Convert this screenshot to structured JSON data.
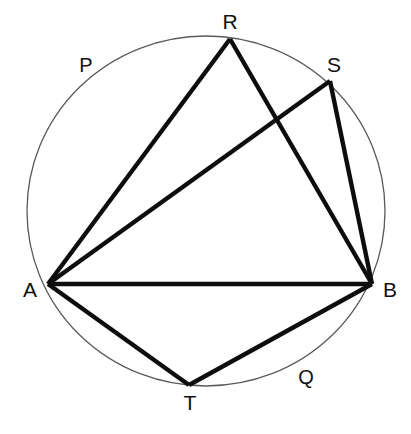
{
  "figure": {
    "background_color": "#ffffff",
    "width": 411,
    "height": 434
  },
  "circle": {
    "name": "circumscribed-circle",
    "center_x": 206,
    "center_y": 211,
    "radius_x": 179,
    "radius_y": 175,
    "stroke_color": "#5a5a5a",
    "stroke_width": 1.3,
    "fill": "none"
  },
  "points": [
    {
      "id": "A",
      "label": "A",
      "x": 48,
      "y": 284,
      "label_x": 30,
      "label_y": 297
    },
    {
      "id": "B",
      "label": "B",
      "x": 372,
      "y": 284,
      "label_x": 390,
      "label_y": 297
    },
    {
      "id": "R",
      "label": "R",
      "x": 230,
      "y": 39,
      "label_x": 230,
      "label_y": 29
    },
    {
      "id": "S",
      "label": "S",
      "x": 330,
      "y": 81,
      "label_x": 334,
      "label_y": 72
    },
    {
      "id": "T",
      "label": "T",
      "x": 189,
      "y": 385,
      "label_x": 190,
      "label_y": 410
    }
  ],
  "arc_labels": [
    {
      "id": "P",
      "label": "P",
      "x": 86,
      "y": 72
    },
    {
      "id": "Q",
      "label": "Q",
      "x": 306,
      "y": 384
    }
  ],
  "chords": [
    {
      "id": "AR",
      "from": "A",
      "to": "R",
      "x1": 48,
      "y1": 284,
      "x2": 230,
      "y2": 39
    },
    {
      "id": "RB",
      "from": "R",
      "to": "B",
      "x1": 230,
      "y1": 39,
      "x2": 372,
      "y2": 284
    },
    {
      "id": "AS",
      "from": "A",
      "to": "S",
      "x1": 48,
      "y1": 284,
      "x2": 330,
      "y2": 81
    },
    {
      "id": "SB",
      "from": "S",
      "to": "B",
      "x1": 330,
      "y1": 81,
      "x2": 372,
      "y2": 284
    },
    {
      "id": "AB",
      "from": "A",
      "to": "B",
      "x1": 48,
      "y1": 284,
      "x2": 372,
      "y2": 284
    },
    {
      "id": "AT",
      "from": "A",
      "to": "T",
      "x1": 48,
      "y1": 284,
      "x2": 189,
      "y2": 385
    },
    {
      "id": "TB",
      "from": "T",
      "to": "B",
      "x1": 189,
      "y1": 385,
      "x2": 372,
      "y2": 284
    }
  ],
  "chord_style": {
    "stroke_color": "#0d0d0d",
    "stroke_width": 4.4,
    "line_cap": "butt"
  }
}
